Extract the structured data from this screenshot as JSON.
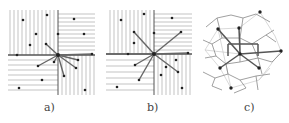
{
  "colors": {
    "hatch": "#9a9a9a",
    "axis": "#555555",
    "edge": "#666666",
    "point": "#222222",
    "voronoi": "#888888",
    "delaunay": "#c8c8c8"
  },
  "panels": [
    {
      "id": "a",
      "label": "a)",
      "center": [
        58,
        55
      ],
      "hatch_vertical": {
        "x": [
          10,
          14,
          18,
          22,
          26,
          30,
          34,
          38,
          42,
          46,
          50,
          54
        ],
        "y1": 10,
        "y2": 55
      },
      "hatch_right_h": {
        "y": [
          14,
          18,
          22,
          26,
          30,
          34,
          38,
          42,
          46,
          50
        ],
        "x1": 58,
        "x2": 95
      },
      "hatch_left_h": {
        "y": [
          60,
          65,
          70,
          75,
          80,
          85,
          90
        ],
        "x1": 8,
        "x2": 58
      },
      "hatch_right_v": {
        "x": [
          62,
          66,
          70,
          74,
          78,
          82,
          86,
          90,
          94
        ],
        "y1": 55,
        "y2": 95
      },
      "axis_h": [
        8,
        55,
        95,
        55
      ],
      "axis_v": [
        58,
        10,
        58,
        95
      ],
      "points": [
        [
          23,
          20
        ],
        [
          47,
          15
        ],
        [
          36,
          34
        ],
        [
          30,
          45
        ],
        [
          17,
          55
        ],
        [
          58,
          34
        ],
        [
          74,
          19
        ],
        [
          84,
          34
        ],
        [
          92,
          54
        ],
        [
          46,
          44
        ],
        [
          78,
          60
        ],
        [
          54,
          62
        ],
        [
          38,
          66
        ],
        [
          76,
          68
        ],
        [
          64,
          76
        ],
        [
          42,
          80
        ],
        [
          19,
          88
        ],
        [
          85,
          90
        ]
      ],
      "edges": [
        [
          46,
          44
        ],
        [
          54,
          62
        ],
        [
          38,
          66
        ],
        [
          64,
          76
        ],
        [
          76,
          68
        ],
        [
          78,
          60
        ],
        [
          92,
          54
        ]
      ]
    },
    {
      "id": "b",
      "label": "b)",
      "center": [
        154,
        54
      ],
      "hatch_vertical": {
        "x": [
          110,
          114,
          118,
          122,
          126,
          130,
          134,
          138,
          142,
          146,
          150
        ],
        "y1": 10,
        "y2": 54
      },
      "hatch_right_h": {
        "y": [
          14,
          18,
          22,
          26,
          30,
          34,
          38,
          42,
          46,
          50
        ],
        "x1": 154,
        "x2": 192
      },
      "hatch_left_h": {
        "y": [
          60,
          66,
          72,
          78,
          84,
          90
        ],
        "x1": 106,
        "x2": 154
      },
      "hatch_right_v": {
        "x": [
          158,
          162,
          166,
          170,
          174,
          178,
          182,
          186,
          190
        ],
        "y1": 54,
        "y2": 95
      },
      "axis_h": [
        106,
        54,
        192,
        54
      ],
      "axis_v": [
        154,
        10,
        154,
        95
      ],
      "points": [
        [
          121,
          20
        ],
        [
          144,
          14
        ],
        [
          134,
          43
        ],
        [
          128,
          54
        ],
        [
          172,
          18
        ],
        [
          154,
          33
        ],
        [
          181,
          32
        ],
        [
          188,
          53
        ],
        [
          134,
          32
        ],
        [
          176,
          60
        ],
        [
          166,
          67
        ],
        [
          135,
          65
        ],
        [
          178,
          72
        ],
        [
          161,
          75
        ],
        [
          139,
          80
        ],
        [
          117,
          87
        ],
        [
          182,
          88
        ]
      ],
      "edges": [
        [
          134,
          32
        ],
        [
          181,
          32
        ],
        [
          188,
          53
        ],
        [
          178,
          72
        ],
        [
          139,
          80
        ],
        [
          135,
          65
        ],
        [
          106,
          54
        ]
      ]
    },
    {
      "id": "c",
      "label": "c)",
      "voronoi_edges": [
        [
          206,
          27,
          217,
          18
        ],
        [
          217,
          18,
          231,
          15
        ],
        [
          231,
          15,
          243,
          18
        ],
        [
          243,
          18,
          256,
          14
        ],
        [
          256,
          14,
          270,
          22
        ],
        [
          217,
          18,
          222,
          38
        ],
        [
          243,
          18,
          240,
          38
        ],
        [
          222,
          38,
          240,
          38
        ],
        [
          240,
          38,
          252,
          44
        ],
        [
          252,
          44,
          266,
          35
        ],
        [
          266,
          35,
          274,
          30
        ],
        [
          266,
          35,
          276,
          42
        ],
        [
          252,
          44,
          258,
          58
        ],
        [
          258,
          58,
          272,
          62
        ],
        [
          272,
          62,
          282,
          52
        ],
        [
          222,
          38,
          212,
          44
        ],
        [
          212,
          44,
          203,
          40
        ],
        [
          212,
          44,
          216,
          56
        ],
        [
          216,
          56,
          205,
          58
        ],
        [
          216,
          56,
          226,
          64
        ],
        [
          226,
          64,
          240,
          62
        ],
        [
          240,
          62,
          258,
          58
        ],
        [
          226,
          64,
          228,
          74
        ],
        [
          228,
          74,
          215,
          78
        ],
        [
          215,
          78,
          203,
          72
        ],
        [
          228,
          74,
          240,
          80
        ],
        [
          240,
          80,
          256,
          76
        ],
        [
          256,
          76,
          270,
          74
        ],
        [
          256,
          76,
          258,
          90
        ],
        [
          240,
          80,
          246,
          88
        ],
        [
          246,
          88,
          234,
          93
        ],
        [
          215,
          78,
          212,
          86
        ],
        [
          212,
          86,
          222,
          90
        ],
        [
          240,
          38,
          240,
          62
        ],
        [
          258,
          58,
          262,
          74
        ]
      ],
      "delaunay_edges": [
        [
          218,
          29,
          239,
          28
        ],
        [
          239,
          28,
          260,
          12
        ],
        [
          218,
          29,
          205,
          50
        ],
        [
          205,
          50,
          220,
          68
        ],
        [
          220,
          68,
          231,
          88
        ],
        [
          231,
          88,
          259,
          80
        ],
        [
          259,
          80,
          281,
          51
        ],
        [
          281,
          51,
          275,
          36
        ],
        [
          275,
          36,
          260,
          12
        ],
        [
          259,
          80,
          270,
          68
        ],
        [
          205,
          50,
          240,
          54
        ],
        [
          218,
          29,
          231,
          88
        ]
      ],
      "primary_edges": [
        [
          218,
          29,
          240,
          54
        ],
        [
          239,
          28,
          240,
          54
        ],
        [
          240,
          54,
          281,
          51
        ],
        [
          240,
          54,
          220,
          68
        ],
        [
          240,
          54,
          259,
          68
        ],
        [
          228,
          44,
          228,
          56
        ],
        [
          228,
          44,
          258,
          44
        ],
        [
          258,
          44,
          258,
          56
        ]
      ],
      "points": [
        [
          218,
          29
        ],
        [
          239,
          28
        ],
        [
          240,
          54
        ],
        [
          281,
          51
        ],
        [
          220,
          68
        ],
        [
          259,
          68
        ],
        [
          260,
          12
        ],
        [
          231,
          88
        ]
      ]
    }
  ]
}
